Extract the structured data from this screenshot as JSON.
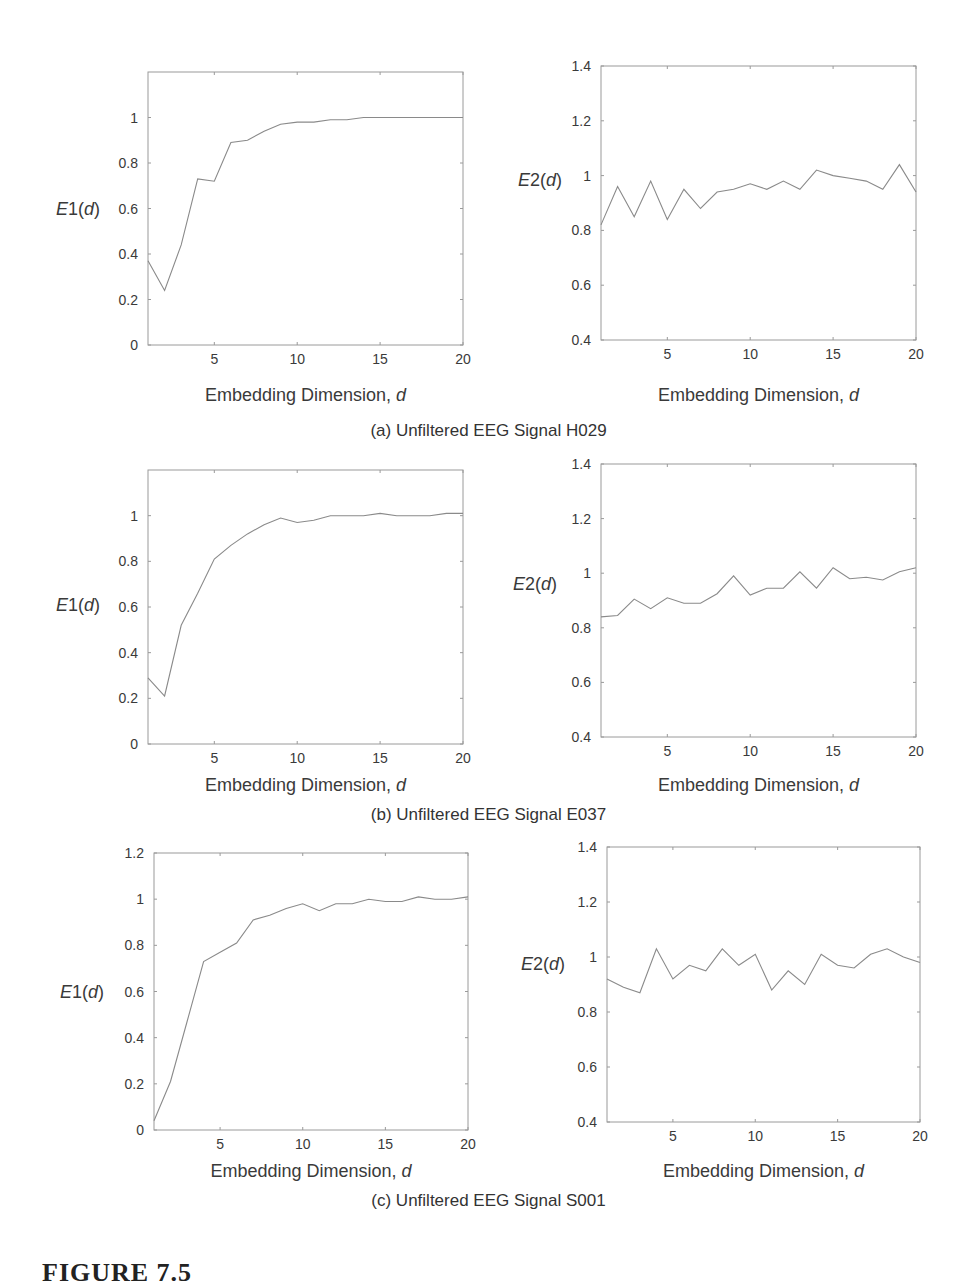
{
  "figure": {
    "title": "FIGURE 7.5",
    "captions": [
      "(a) Unfiltered EEG Signal H029",
      "(b) Unfiltered EEG Signal E037",
      "(c) Unfiltered EEG Signal S001"
    ]
  },
  "chart_data": [
    {
      "id": "a-E1",
      "type": "line",
      "panel": "(a)",
      "signal": "H029",
      "title": "",
      "xlabel": "Embedding Dimension, d",
      "ylabel": "E1(d)",
      "xlim": [
        1,
        20
      ],
      "ylim": [
        0,
        1.2
      ],
      "xticks": [
        5,
        10,
        15,
        20
      ],
      "yticks": [
        0,
        0.2,
        0.4,
        0.6,
        0.8,
        1
      ],
      "grid": false,
      "legend": null,
      "x": [
        1,
        2,
        3,
        4,
        5,
        6,
        7,
        8,
        9,
        10,
        11,
        12,
        13,
        14,
        15,
        16,
        17,
        18,
        19,
        20
      ],
      "values": [
        0.37,
        0.24,
        0.44,
        0.73,
        0.72,
        0.89,
        0.9,
        0.94,
        0.97,
        0.98,
        0.98,
        0.99,
        0.99,
        1.0,
        1.0,
        1.0,
        1.0,
        1.0,
        1.0,
        1.0
      ]
    },
    {
      "id": "a-E2",
      "type": "line",
      "panel": "(a)",
      "signal": "H029",
      "title": "",
      "xlabel": "Embedding Dimension, d",
      "ylabel": "E2(d)",
      "xlim": [
        1,
        20
      ],
      "ylim": [
        0.4,
        1.4
      ],
      "xticks": [
        5,
        10,
        15,
        20
      ],
      "yticks": [
        0.4,
        0.6,
        0.8,
        1,
        1.2,
        1.4
      ],
      "grid": false,
      "legend": null,
      "x": [
        1,
        2,
        3,
        4,
        5,
        6,
        7,
        8,
        9,
        10,
        11,
        12,
        13,
        14,
        15,
        16,
        17,
        18,
        19,
        20
      ],
      "values": [
        0.82,
        0.96,
        0.85,
        0.98,
        0.84,
        0.95,
        0.88,
        0.94,
        0.95,
        0.97,
        0.95,
        0.98,
        0.95,
        1.02,
        1.0,
        0.99,
        0.98,
        0.95,
        1.04,
        0.94
      ]
    },
    {
      "id": "b-E1",
      "type": "line",
      "panel": "(b)",
      "signal": "E037",
      "title": "",
      "xlabel": "Embedding Dimension, d",
      "ylabel": "E1(d)",
      "xlim": [
        1,
        20
      ],
      "ylim": [
        0,
        1.2
      ],
      "xticks": [
        5,
        10,
        15,
        20
      ],
      "yticks": [
        0,
        0.2,
        0.4,
        0.6,
        0.8,
        1
      ],
      "grid": false,
      "legend": null,
      "x": [
        1,
        2,
        3,
        4,
        5,
        6,
        7,
        8,
        9,
        10,
        11,
        12,
        13,
        14,
        15,
        16,
        17,
        18,
        19,
        20
      ],
      "values": [
        0.29,
        0.21,
        0.52,
        0.66,
        0.81,
        0.87,
        0.92,
        0.96,
        0.99,
        0.97,
        0.98,
        1.0,
        1.0,
        1.0,
        1.01,
        1.0,
        1.0,
        1.0,
        1.01,
        1.01
      ]
    },
    {
      "id": "b-E2",
      "type": "line",
      "panel": "(b)",
      "signal": "E037",
      "title": "",
      "xlabel": "Embedding Dimension, d",
      "ylabel": "E2(d)",
      "xlim": [
        1,
        20
      ],
      "ylim": [
        0.4,
        1.4
      ],
      "xticks": [
        5,
        10,
        15,
        20
      ],
      "yticks": [
        0.4,
        0.6,
        0.8,
        1,
        1.2,
        1.4
      ],
      "grid": false,
      "legend": null,
      "x": [
        1,
        2,
        3,
        4,
        5,
        6,
        7,
        8,
        9,
        10,
        11,
        12,
        13,
        14,
        15,
        16,
        17,
        18,
        19,
        20
      ],
      "values": [
        0.84,
        0.845,
        0.905,
        0.87,
        0.91,
        0.89,
        0.89,
        0.925,
        0.99,
        0.92,
        0.945,
        0.945,
        1.005,
        0.945,
        1.02,
        0.98,
        0.985,
        0.975,
        1.005,
        1.02
      ]
    },
    {
      "id": "c-E1",
      "type": "line",
      "panel": "(c)",
      "signal": "S001",
      "title": "",
      "xlabel": "Embedding Dimension, d",
      "ylabel": "E1(d)",
      "xlim": [
        1,
        20
      ],
      "ylim": [
        0,
        1.2
      ],
      "xticks": [
        5,
        10,
        15,
        20
      ],
      "yticks": [
        0,
        0.2,
        0.4,
        0.6,
        0.8,
        1,
        1.2
      ],
      "grid": false,
      "legend": null,
      "x": [
        1,
        2,
        3,
        4,
        5,
        6,
        7,
        8,
        9,
        10,
        11,
        12,
        13,
        14,
        15,
        16,
        17,
        18,
        19,
        20
      ],
      "values": [
        0.04,
        0.21,
        0.47,
        0.73,
        0.77,
        0.81,
        0.91,
        0.93,
        0.96,
        0.98,
        0.95,
        0.98,
        0.98,
        1.0,
        0.99,
        0.99,
        1.01,
        1.0,
        1.0,
        1.01
      ]
    },
    {
      "id": "c-E2",
      "type": "line",
      "panel": "(c)",
      "signal": "S001",
      "title": "",
      "xlabel": "Embedding Dimension, d",
      "ylabel": "E2(d)",
      "xlim": [
        1,
        20
      ],
      "ylim": [
        0.4,
        1.4
      ],
      "xticks": [
        5,
        10,
        15,
        20
      ],
      "yticks": [
        0.4,
        0.6,
        0.8,
        1,
        1.2,
        1.4
      ],
      "grid": false,
      "legend": null,
      "x": [
        1,
        2,
        3,
        4,
        5,
        6,
        7,
        8,
        9,
        10,
        11,
        12,
        13,
        14,
        15,
        16,
        17,
        18,
        19,
        20
      ],
      "values": [
        0.92,
        0.89,
        0.87,
        1.03,
        0.92,
        0.97,
        0.95,
        1.03,
        0.97,
        1.01,
        0.88,
        0.95,
        0.9,
        1.01,
        0.97,
        0.96,
        1.01,
        1.03,
        1.0,
        0.98
      ]
    }
  ],
  "layout": {
    "plots": [
      {
        "chart": 0,
        "left": 148,
        "top": 72,
        "right": 463,
        "bottom": 345,
        "ylabel_x": 78,
        "ylabel_y": 215,
        "xlabel_y": 401
      },
      {
        "chart": 1,
        "left": 601,
        "top": 66,
        "right": 916,
        "bottom": 340,
        "ylabel_x": 540,
        "ylabel_y": 186,
        "xlabel_y": 401
      },
      {
        "chart": 2,
        "left": 148,
        "top": 470,
        "right": 463,
        "bottom": 744,
        "ylabel_x": 78,
        "ylabel_y": 611,
        "xlabel_y": 791
      },
      {
        "chart": 3,
        "left": 601,
        "top": 464,
        "right": 916,
        "bottom": 737,
        "ylabel_x": 535,
        "ylabel_y": 590,
        "xlabel_y": 791
      },
      {
        "chart": 4,
        "left": 154,
        "top": 853,
        "right": 468,
        "bottom": 1130,
        "ylabel_x": 82,
        "ylabel_y": 998,
        "xlabel_y": 1177
      },
      {
        "chart": 5,
        "left": 607,
        "top": 847,
        "right": 920,
        "bottom": 1122,
        "ylabel_x": 543,
        "ylabel_y": 970,
        "xlabel_y": 1177
      }
    ],
    "caption_tops": [
      421,
      805,
      1191
    ],
    "line_color": "#8a8a8a",
    "axis_color": "#9a9a9a"
  }
}
